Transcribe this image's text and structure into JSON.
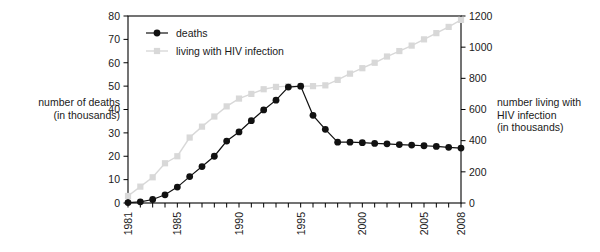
{
  "chart_data": {
    "type": "line",
    "title": "",
    "xlabel": "",
    "ylabel": "number of deaths\n(in thousands)",
    "y2label": "number living with\nHIV infection\n(in thousands)",
    "x": [
      1981,
      1982,
      1983,
      1984,
      1985,
      1986,
      1987,
      1988,
      1989,
      1990,
      1991,
      1992,
      1993,
      1994,
      1995,
      1996,
      1997,
      1998,
      1999,
      2000,
      2001,
      2002,
      2003,
      2004,
      2005,
      2006,
      2007,
      2008
    ],
    "xlim": [
      1981,
      2008
    ],
    "ylim": [
      0,
      80
    ],
    "y2lim": [
      0,
      1200
    ],
    "yticks": [
      0,
      10,
      20,
      30,
      40,
      50,
      60,
      70,
      80
    ],
    "y2ticks": [
      0,
      200,
      400,
      600,
      800,
      1000,
      1200
    ],
    "xticks": [
      1981,
      1982,
      1983,
      1984,
      1985,
      1986,
      1987,
      1988,
      1989,
      1990,
      1991,
      1992,
      1993,
      1994,
      1995,
      1996,
      1997,
      1998,
      1999,
      2000,
      2001,
      2002,
      2003,
      2004,
      2005,
      2006,
      2007,
      2008
    ],
    "xtick_labels_shown": [
      "1981",
      "1985",
      "1990",
      "1995",
      "2000",
      "2005",
      "2008"
    ],
    "grid": false,
    "legend_position": "top-left-inside",
    "series": [
      {
        "name": "deaths",
        "axis": "left",
        "color": "#111111",
        "marker": "circle",
        "values": [
          0.2,
          0.5,
          1.5,
          3.5,
          6.8,
          11.3,
          15.6,
          20.0,
          26.5,
          30.4,
          35.2,
          39.8,
          44.0,
          49.6,
          50.0,
          37.5,
          31.5,
          26.0,
          26.0,
          25.8,
          25.5,
          25.3,
          25.0,
          24.8,
          24.5,
          24.2,
          23.8,
          23.5
        ]
      },
      {
        "name": "living with HIV infection",
        "axis": "right",
        "color": "#d8d8d8",
        "marker": "square",
        "values": [
          45,
          105,
          165,
          255,
          300,
          420,
          490,
          555,
          620,
          670,
          700,
          730,
          745,
          750,
          750,
          750,
          755,
          790,
          830,
          865,
          900,
          940,
          975,
          1010,
          1050,
          1090,
          1130,
          1175
        ]
      }
    ],
    "legend": [
      "deaths",
      "living with HIV infection"
    ]
  },
  "labels": {
    "left_axis_title": "number of deaths\n(in thousands)",
    "right_axis_title": "number living with\nHIV infection\n(in thousands)"
  }
}
